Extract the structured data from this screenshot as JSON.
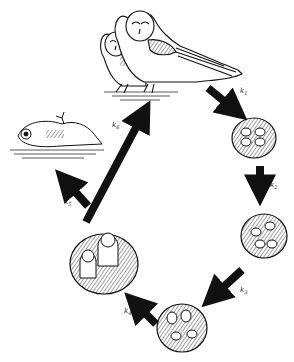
{
  "diagram": {
    "colors": {
      "ink": "#111111",
      "background": "#ffffff"
    },
    "stages": [
      {
        "id": "adults",
        "label": "Adult owl pair"
      },
      {
        "id": "eggs",
        "label": "Eggs in nest"
      },
      {
        "id": "hatching",
        "label": "Hatching eggs in nest"
      },
      {
        "id": "nestlings",
        "label": "Young nestlings"
      },
      {
        "id": "fledglings",
        "label": "Older owlets in nest"
      },
      {
        "id": "dead",
        "label": "Dead owl"
      }
    ],
    "transitions": [
      {
        "from": "adults",
        "to": "eggs",
        "label": "k",
        "sub": "1"
      },
      {
        "from": "eggs",
        "to": "hatching",
        "label": "k",
        "sub": "2"
      },
      {
        "from": "hatching",
        "to": "nestlings",
        "label": "k",
        "sub": "3"
      },
      {
        "from": "nestlings",
        "to": "fledglings",
        "label": "k",
        "sub": "4"
      },
      {
        "from": "fledglings",
        "to": "dead",
        "label": "k",
        "sub": "5"
      },
      {
        "from": "fledglings",
        "to": "adults",
        "label": "k",
        "sub": "6"
      }
    ]
  }
}
